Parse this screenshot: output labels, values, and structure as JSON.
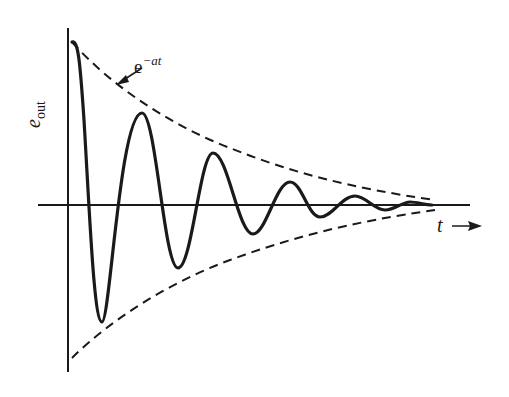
{
  "figure": {
    "type": "damped-oscillation-diagram",
    "y_axis_label": {
      "symbol": "e",
      "subscript": "out"
    },
    "x_axis_label": {
      "symbol": "t"
    },
    "envelope_label": {
      "base": "e",
      "exponent": "−at"
    },
    "colors": {
      "stroke": "#1a1a1a",
      "background": "#ffffff"
    }
  },
  "curve": {
    "description": "Damped sinusoid decaying within exponential envelope ±e^(−at)",
    "extrema_px": [
      [
        72,
        42
      ],
      [
        102,
        322
      ],
      [
        142,
        113
      ],
      [
        178,
        268
      ],
      [
        213,
        153
      ],
      [
        253,
        234
      ],
      [
        290,
        182
      ],
      [
        320,
        217
      ],
      [
        355,
        196
      ],
      [
        385,
        210
      ],
      [
        410,
        202
      ],
      [
        432,
        205
      ]
    ]
  }
}
